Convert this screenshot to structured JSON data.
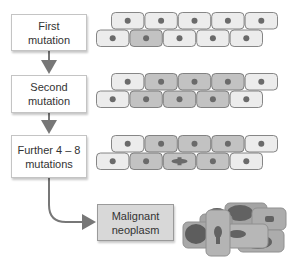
{
  "diagram": {
    "stages": [
      {
        "label_line1": "First",
        "label_line2": "mutation",
        "mutated_cells": {
          "row1": [],
          "row2": [
            1
          ]
        },
        "mitotic": null
      },
      {
        "label_line1": "Second",
        "label_line2": "mutation",
        "mutated_cells": {
          "row1": [
            1,
            2,
            3
          ],
          "row2": [
            1,
            2,
            3
          ]
        },
        "mitotic": null
      },
      {
        "label_line1": "Further 4 – 8",
        "label_line2": "mutations",
        "mutated_cells": {
          "row1": [
            1,
            2,
            3
          ],
          "row2": [
            1,
            2,
            3
          ]
        },
        "mitotic": {
          "row": 2,
          "index": 2
        }
      }
    ],
    "final": {
      "label_line1": "Malignant",
      "label_line2": "neoplasm"
    },
    "colors": {
      "normal_cell": "#ececec",
      "mutated_cell": "#c2c2c2",
      "cell_border": "#6a6a6a",
      "nucleus": "#6a6a6a",
      "arrow": "#777777",
      "malignant_box": "#d8d8d8",
      "malignant_cell": "#a0a0a0",
      "malignant_nucleus": "#5a5a5a"
    }
  }
}
